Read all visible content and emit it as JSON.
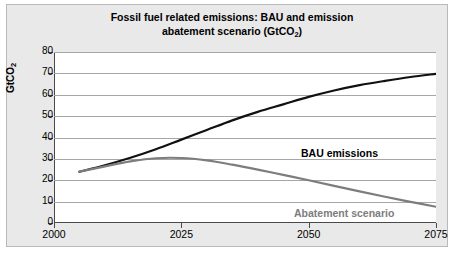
{
  "figure": {
    "title_line1": "Fossil fuel related emissions: BAU and emission",
    "title_line2_prefix": "abatement scenario (GtCO",
    "title_sub": "2",
    "title_line2_suffix": ")",
    "background_color": "#e9e9e9",
    "plot_background_color": "#ffffff",
    "border_color": "#b9b9b9"
  },
  "axis": {
    "y_title_prefix": "GtCO",
    "y_title_sub": "2",
    "y_ticks": [
      "80",
      "70",
      "60",
      "50",
      "40",
      "30",
      "20",
      "10",
      "0"
    ],
    "x_ticks": [
      "2000",
      "2025",
      "2050",
      "2075"
    ]
  },
  "legend": {
    "bau_label": "BAU emissions",
    "abatement_label": "Abatement scenario",
    "bau_color": "#111111",
    "abatement_color": "#7d7d7d"
  },
  "chart_data": {
    "type": "line",
    "title": "Fossil fuel related emissions: BAU and emission abatement scenario (GtCO2)",
    "xlabel": "",
    "ylabel": "GtCO2",
    "xlim": [
      2000,
      2075
    ],
    "ylim": [
      0,
      80
    ],
    "ytick_values": [
      0,
      10,
      20,
      30,
      40,
      50,
      60,
      70,
      80
    ],
    "xtick_values": [
      2000,
      2025,
      2050,
      2075
    ],
    "grid": true,
    "legend_position": "inline-annotation",
    "series": [
      {
        "name": "BAU emissions",
        "color": "#111111",
        "x": [
          2005,
          2010,
          2015,
          2020,
          2025,
          2030,
          2035,
          2040,
          2045,
          2050,
          2055,
          2060,
          2065,
          2070,
          2075
        ],
        "values": [
          24,
          27,
          30.5,
          34.5,
          39,
          43.5,
          48,
          52,
          55.5,
          59,
          62,
          64.5,
          66.5,
          68.3,
          69.8
        ]
      },
      {
        "name": "Abatement scenario",
        "color": "#7d7d7d",
        "x": [
          2005,
          2010,
          2015,
          2020,
          2025,
          2030,
          2035,
          2040,
          2045,
          2050,
          2055,
          2060,
          2065,
          2070,
          2075
        ],
        "values": [
          24,
          26.5,
          28.8,
          30.3,
          30.4,
          29.3,
          27.3,
          25,
          22.5,
          20,
          17.4,
          14.8,
          12.3,
          9.9,
          7.6
        ]
      }
    ]
  }
}
